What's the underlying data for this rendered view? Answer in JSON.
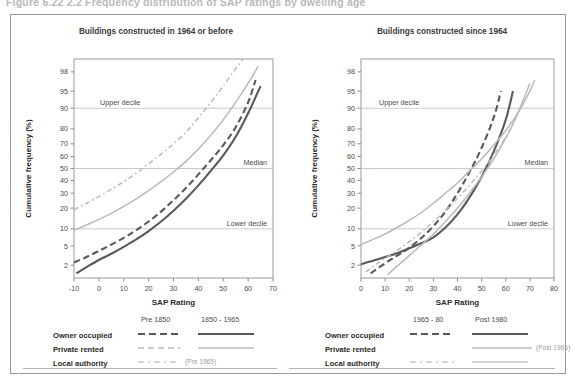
{
  "figure": {
    "caption": "Figure 6.22  2.2  Frequency distribution of SAP ratings by dwelling age"
  },
  "colors": {
    "dark": "#58585e",
    "dark_alt": "#4f4f55",
    "light": "#b9b9bd",
    "light_alt": "#c3c3c7",
    "grid": "#c9c9c9",
    "axis": "#8d8d8d",
    "frame": "#9a9a9a",
    "text": "#3a3a3a",
    "muted": "#9b9b9b"
  },
  "annotations": {
    "upper_decile": "Upper decile",
    "median": "Median",
    "lower_decile": "Lower decile"
  },
  "axis_titles": {
    "x": "SAP Rating",
    "y": "Cumulative frequency (%)"
  },
  "chart_data": [
    {
      "type": "line",
      "id": "pre-1964",
      "title": "Buildings constructed in 1964 or before",
      "xlabel": "SAP Rating",
      "ylabel": "Cumulative frequency (%)",
      "xlim": [
        -10,
        70
      ],
      "xticks": [
        -10,
        0,
        10,
        20,
        30,
        40,
        50,
        60,
        70
      ],
      "yscale": "probit",
      "ylim": [
        1,
        99
      ],
      "yticks": [
        2,
        5,
        10,
        20,
        30,
        40,
        50,
        60,
        70,
        80,
        90,
        95,
        98
      ],
      "grid": "horizontal-at-10-50-90",
      "reference_lines": [
        {
          "value": 90,
          "label": "Upper decile"
        },
        {
          "value": 50,
          "label": "Median"
        },
        {
          "value": 10,
          "label": "Lower decile"
        }
      ],
      "legend_position": "below",
      "legend_columns": [
        "Pre 1850",
        "1850 - 1965"
      ],
      "legend_rows": [
        "Owner occupied",
        "Private rented",
        "Local authority"
      ],
      "legend_notes": [
        "(Pre 1965)"
      ],
      "series": [
        {
          "name": "Owner occupied, Pre 1850",
          "style": "dashed",
          "shade": "dark",
          "x": [
            -10,
            -5,
            0,
            5,
            10,
            15,
            20,
            25,
            30,
            35,
            40,
            45,
            50,
            55,
            60,
            63
          ],
          "values": [
            2.3,
            3.0,
            4.0,
            5.3,
            7.0,
            9.5,
            13.0,
            18.0,
            25.0,
            34.0,
            45.0,
            57.0,
            69.0,
            81.0,
            92.0,
            97.0
          ]
        },
        {
          "name": "Owner occupied, 1850 - 1965",
          "style": "solid",
          "shade": "dark",
          "x": [
            -9,
            -5,
            0,
            5,
            10,
            15,
            20,
            25,
            30,
            35,
            40,
            45,
            50,
            55,
            60,
            65
          ],
          "values": [
            1.3,
            1.8,
            2.6,
            3.5,
            4.8,
            6.6,
            9.2,
            13.0,
            18.5,
            26.0,
            36.0,
            48.0,
            61.0,
            75.0,
            88.0,
            96.0
          ]
        },
        {
          "name": "Private rented, 1850 - 1965",
          "style": "solid",
          "shade": "light",
          "x": [
            -10,
            -5,
            0,
            5,
            10,
            15,
            20,
            25,
            30,
            35,
            40,
            45,
            50,
            55,
            60,
            64
          ],
          "values": [
            9.5,
            11.5,
            14.0,
            17.0,
            21.0,
            26.0,
            32.0,
            39.0,
            47.0,
            56.0,
            66.0,
            76.0,
            85.0,
            92.0,
            96.5,
            98.5
          ]
        },
        {
          "name": "Local authority, Pre 1965",
          "style": "dash-dot",
          "shade": "light",
          "x": [
            -10,
            -5,
            0,
            5,
            10,
            15,
            20,
            25,
            30,
            35,
            40,
            45,
            50,
            55,
            58
          ],
          "values": [
            19.0,
            23.0,
            27.5,
            33.0,
            39.0,
            46.0,
            54.0,
            62.0,
            70.0,
            78.0,
            86.0,
            92.0,
            96.0,
            98.3,
            99.0
          ]
        }
      ]
    },
    {
      "type": "line",
      "id": "post-1964",
      "title": "Buildings constructed since 1964",
      "xlabel": "SAP Rating",
      "ylabel": "Cumulative frequency (%)",
      "xlim": [
        0,
        80
      ],
      "xticks": [
        0,
        10,
        20,
        30,
        40,
        50,
        60,
        70,
        80
      ],
      "yscale": "probit",
      "ylim": [
        1,
        99
      ],
      "yticks": [
        2,
        5,
        10,
        20,
        30,
        40,
        50,
        60,
        70,
        80,
        90,
        95,
        98
      ],
      "grid": "horizontal-at-10-50-90",
      "reference_lines": [
        {
          "value": 90,
          "label": "Upper decile"
        },
        {
          "value": 50,
          "label": "Median"
        },
        {
          "value": 10,
          "label": "Lower decile"
        }
      ],
      "legend_position": "below",
      "legend_columns": [
        "1965 - 80",
        "Post 1980"
      ],
      "legend_rows": [
        "Owner occupied",
        "Private rented",
        "Local authority"
      ],
      "legend_notes": [
        "(Post 1965)"
      ],
      "series": [
        {
          "name": "Owner occupied, 1965 - 80",
          "style": "dashed",
          "shade": "dark",
          "x": [
            4,
            10,
            15,
            20,
            25,
            30,
            35,
            40,
            45,
            50,
            55,
            58
          ],
          "values": [
            1.3,
            2.2,
            3.2,
            4.6,
            7.0,
            11.0,
            18.0,
            30.0,
            47.0,
            67.0,
            86.0,
            95.0
          ]
        },
        {
          "name": "Owner occupied, Post 1980",
          "style": "solid",
          "shade": "dark",
          "x": [
            0,
            5,
            10,
            15,
            20,
            25,
            30,
            35,
            40,
            45,
            50,
            55,
            60,
            63
          ],
          "values": [
            2.1,
            2.5,
            3.0,
            3.6,
            4.5,
            5.6,
            7.2,
            10.5,
            16.5,
            27.0,
            43.0,
            64.0,
            85.0,
            95.0
          ]
        },
        {
          "name": "Private rented, Post 1965",
          "style": "solid",
          "shade": "light",
          "x": [
            0,
            5,
            10,
            15,
            20,
            25,
            30,
            35,
            40,
            45,
            50,
            55,
            60,
            65,
            70,
            72
          ],
          "values": [
            5.3,
            6.6,
            8.2,
            10.5,
            13.5,
            17.5,
            23.0,
            30.0,
            38.0,
            48.0,
            58.0,
            69.0,
            79.0,
            88.0,
            95.0,
            97.0
          ]
        },
        {
          "name": "Local authority, Post 1980",
          "style": "solid",
          "shade": "light",
          "x": [
            11,
            15,
            20,
            25,
            30,
            35,
            40,
            45,
            50,
            55,
            60,
            65,
            70
          ],
          "values": [
            1.2,
            1.9,
            3.2,
            5.2,
            8.2,
            13.0,
            20.0,
            30.0,
            43.0,
            58.0,
            74.0,
            88.0,
            96.5
          ]
        },
        {
          "name": "Local authority, 1965 - 80",
          "style": "dash-dot",
          "shade": "light",
          "x": [
            2,
            8,
            14,
            20,
            26,
            32,
            38,
            44,
            50,
            56,
            62,
            66
          ],
          "values": [
            1.4,
            2.4,
            3.8,
            6.0,
            9.5,
            15.0,
            23.0,
            34.0,
            48.0,
            64.0,
            80.0,
            90.0
          ]
        }
      ]
    }
  ]
}
